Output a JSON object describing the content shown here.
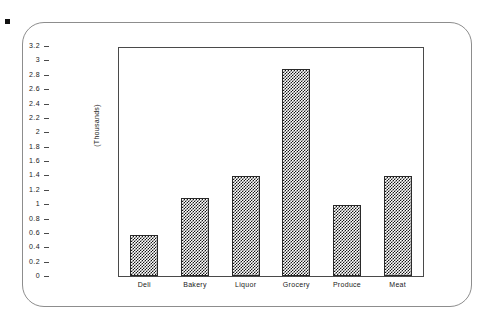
{
  "chart_data": {
    "type": "bar",
    "title": "",
    "subtitle": "",
    "xlabel": "",
    "ylabel": "(Thousands)",
    "categories": [
      "Deli",
      "Bakery",
      "Liquor",
      "Grocery",
      "Produce",
      "Meat"
    ],
    "values": [
      0.57,
      1.1,
      1.4,
      2.9,
      1.0,
      1.41
    ],
    "series": [
      {
        "name": "Sales",
        "values": [
          0.57,
          1.1,
          1.4,
          2.9,
          1.0,
          1.41
        ]
      }
    ],
    "ylim": [
      0,
      3.2
    ],
    "ytick_step": 0.2,
    "ytick_labels": [
      "0",
      "0.2",
      "0.4",
      "0.6",
      "0.8",
      "1",
      "1.2",
      "1.4",
      "1.6",
      "1.8",
      "2",
      "2.2",
      "2.4",
      "2.6",
      "2.8",
      "3",
      "3.2"
    ],
    "ytick_values": [
      0,
      0.2,
      0.4,
      0.6,
      0.8,
      1,
      1.2,
      1.4,
      1.6,
      1.8,
      2,
      2.2,
      2.4,
      2.6,
      2.8,
      3,
      3.2
    ],
    "grid": false,
    "legend": false,
    "legend_position": "none",
    "bar_fill": "checkerboard-pattern",
    "colors": {
      "bar_fill": "#161616",
      "bar_border": "#2a2a2a",
      "axis": "#4a4a4a",
      "text": "#1a1a1a",
      "frame": "#8d8d8d",
      "background": "#ffffff"
    },
    "annotations": []
  },
  "decorations": {
    "corner_marker": "square-marker"
  }
}
